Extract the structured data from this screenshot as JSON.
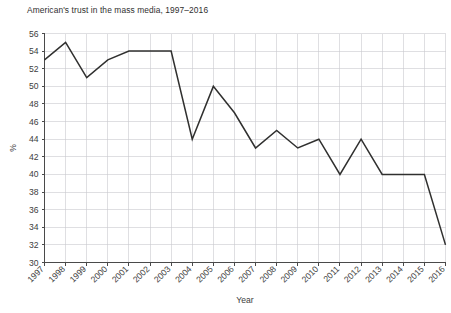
{
  "chart_data": {
    "type": "line",
    "title": "American's trust in the mass media, 1997–2016",
    "xlabel": "Year",
    "ylabel": "%",
    "categories": [
      "1997",
      "1998",
      "1999",
      "2000",
      "2001",
      "2002",
      "2003",
      "2004",
      "2005",
      "2006",
      "2007",
      "2008",
      "2009",
      "2010",
      "2011",
      "2012",
      "2013",
      "2014",
      "2015",
      "2016"
    ],
    "x": [
      1997,
      1998,
      1999,
      2000,
      2001,
      2002,
      2003,
      2004,
      2005,
      2006,
      2007,
      2008,
      2009,
      2010,
      2011,
      2012,
      2013,
      2014,
      2015,
      2016
    ],
    "values": [
      53,
      55,
      51,
      53,
      54,
      54,
      54,
      44,
      50,
      47,
      43,
      45,
      43,
      44,
      40,
      44,
      40,
      40,
      40,
      32
    ],
    "series": [
      {
        "name": "Trust in mass media",
        "values": [
          53,
          55,
          51,
          53,
          54,
          54,
          54,
          44,
          50,
          47,
          43,
          45,
          43,
          44,
          40,
          44,
          40,
          40,
          40,
          32
        ]
      }
    ],
    "ylim": [
      30,
      56
    ],
    "yticks": [
      30,
      32,
      34,
      36,
      38,
      40,
      42,
      44,
      46,
      48,
      50,
      52,
      54,
      56
    ],
    "ytick_labels": [
      "30",
      "32",
      "34",
      "36",
      "38",
      "40",
      "42",
      "44",
      "46",
      "48",
      "50",
      "52",
      "54",
      "56"
    ],
    "xtick_rotation": 45,
    "grid": true,
    "legend": false,
    "line_color": "#30302f",
    "grid_color": "#c9c9cf",
    "axis_color": "#4a4a4a"
  }
}
